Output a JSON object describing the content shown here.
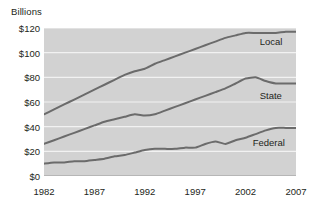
{
  "chart_data": {
    "type": "line",
    "title": "",
    "ylabel": "Billions",
    "xlabel": "",
    "ylim": [
      0,
      120
    ],
    "xlim": [
      1982,
      2007
    ],
    "grid": true,
    "legend_position": "inline-right",
    "ytick_labels": [
      "$0",
      "$20",
      "$40",
      "$60",
      "$80",
      "$100",
      "$120"
    ],
    "ytick_values": [
      0,
      20,
      40,
      60,
      80,
      100,
      120
    ],
    "xtick_labels": [
      "1982",
      "1987",
      "1992",
      "1997",
      "2002",
      "2007"
    ],
    "xtick_values": [
      1982,
      1987,
      1992,
      1997,
      2002,
      2007
    ],
    "x": [
      1982,
      1983,
      1984,
      1985,
      1986,
      1987,
      1988,
      1989,
      1990,
      1991,
      1992,
      1993,
      1994,
      1995,
      1996,
      1997,
      1998,
      1999,
      2000,
      2001,
      2002,
      2003,
      2004,
      2005,
      2006,
      2007
    ],
    "series": [
      {
        "name": "Local",
        "color": "#6b6b6b",
        "values": [
          50,
          54,
          58,
          62,
          66,
          70,
          74,
          78,
          82,
          85,
          87,
          91,
          94,
          97,
          100,
          103,
          106,
          109,
          112,
          114,
          116,
          116,
          116,
          116,
          117,
          117
        ]
      },
      {
        "name": "State",
        "color": "#6b6b6b",
        "values": [
          26,
          29,
          32,
          35,
          38,
          41,
          44,
          46,
          48,
          50,
          49,
          50,
          53,
          56,
          59,
          62,
          65,
          68,
          71,
          75,
          79,
          80,
          77,
          75,
          75,
          75
        ]
      },
      {
        "name": "Federal",
        "color": "#6b6b6b",
        "values": [
          10,
          11,
          11,
          12,
          12,
          13,
          14,
          16,
          17,
          19,
          21,
          22,
          22,
          22,
          23,
          23,
          26,
          28,
          26,
          29,
          31,
          34,
          37,
          39,
          39,
          39
        ]
      }
    ],
    "annotations": [
      {
        "text": "Local",
        "x": 2003.4,
        "y": 109
      },
      {
        "text": "State",
        "x": 2003.4,
        "y": 65
      },
      {
        "text": "Federal",
        "x": 2002.7,
        "y": 27
      }
    ],
    "style": {
      "plot_background": "#d2d2d2",
      "gridline_color": "#f2f2f2",
      "line_color": "#6b6b6b",
      "text_color": "#231f20"
    }
  }
}
